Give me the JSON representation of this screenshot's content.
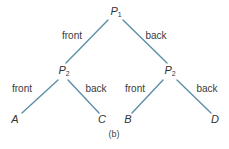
{
  "diagram": {
    "caption": "(b)",
    "line_color": "#5b8fa8",
    "nodes": {
      "root": {
        "label": "P",
        "sub": "1"
      },
      "left_mid": {
        "label": "P",
        "sub": "2"
      },
      "right_mid": {
        "label": "P",
        "sub": "2"
      },
      "leaf_a": {
        "label": "A"
      },
      "leaf_c": {
        "label": "C"
      },
      "leaf_b": {
        "label": "B"
      },
      "leaf_d": {
        "label": "D"
      }
    },
    "edges": {
      "root_left": "front",
      "root_right": "back",
      "left_left": "front",
      "left_right": "back",
      "right_left": "front",
      "right_right": "back"
    }
  }
}
